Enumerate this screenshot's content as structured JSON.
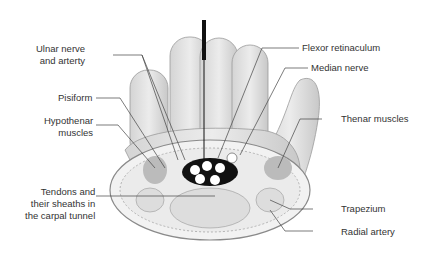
{
  "diagram": {
    "labels": {
      "ulnar": "Ulnar nerve\nand arterty",
      "pisiform": "Pisiform",
      "hypothenar": "Hypothenar\nmuscles",
      "tendons": "Tendons and\ntheir sheaths in\nthe carpal tunnel",
      "flexor": "Flexor retinaculum",
      "median": "Median nerve",
      "thenar": "Thenar muscles",
      "trapezium": "Trapezium",
      "radial": "Radial artery"
    },
    "colors": {
      "line": "#444444",
      "skin": "#e2e2e2",
      "skin_shadow": "#bdbdbd",
      "probe": "#111111"
    }
  }
}
